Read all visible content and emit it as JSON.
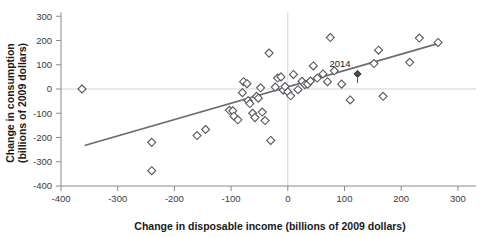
{
  "chart_data": {
    "type": "scatter",
    "title": "",
    "xlabel": "Change in disposable income (billions of 2009 dollars)",
    "ylabel": "Change in consumption (billions of 2009 dollars)",
    "xlim": [
      -400,
      300
    ],
    "ylim": [
      -400,
      300
    ],
    "xticks": [
      -400,
      -300,
      -200,
      -100,
      0,
      100,
      200,
      300
    ],
    "xticklabels": [
      "-400",
      "-300",
      "-200",
      "-100",
      "0",
      "100",
      "200",
      "300"
    ],
    "yticks": [
      -400,
      -300,
      -200,
      -100,
      0,
      100,
      200,
      300
    ],
    "yticklabels": [
      "-400",
      "-300",
      "-200",
      "-100",
      "0",
      "100",
      "200",
      "300"
    ],
    "grid": false,
    "zero_lines": true,
    "legend": null,
    "marker": "diamond",
    "marker_style": "open",
    "points": [
      {
        "x": -363,
        "y": 0
      },
      {
        "x": -240,
        "y": -220
      },
      {
        "x": -240,
        "y": -337
      },
      {
        "x": -160,
        "y": -192
      },
      {
        "x": -145,
        "y": -167
      },
      {
        "x": -103,
        "y": -88
      },
      {
        "x": -97,
        "y": -90
      },
      {
        "x": -95,
        "y": -112
      },
      {
        "x": -88,
        "y": -127
      },
      {
        "x": -80,
        "y": -15
      },
      {
        "x": -78,
        "y": 30
      },
      {
        "x": -72,
        "y": 22
      },
      {
        "x": -70,
        "y": -48
      },
      {
        "x": -67,
        "y": -60
      },
      {
        "x": -62,
        "y": -100
      },
      {
        "x": -58,
        "y": -118
      },
      {
        "x": -55,
        "y": -30
      },
      {
        "x": -52,
        "y": -38
      },
      {
        "x": -48,
        "y": 5
      },
      {
        "x": -45,
        "y": -95
      },
      {
        "x": -40,
        "y": -130
      },
      {
        "x": -33,
        "y": 148
      },
      {
        "x": -30,
        "y": -212
      },
      {
        "x": -22,
        "y": 8
      },
      {
        "x": -18,
        "y": 45
      },
      {
        "x": -12,
        "y": 50
      },
      {
        "x": -8,
        "y": -5
      },
      {
        "x": -5,
        "y": 10
      },
      {
        "x": 0,
        "y": -12
      },
      {
        "x": 5,
        "y": -28
      },
      {
        "x": 10,
        "y": 60
      },
      {
        "x": 18,
        "y": -3
      },
      {
        "x": 25,
        "y": 32
      },
      {
        "x": 30,
        "y": 18
      },
      {
        "x": 35,
        "y": 20
      },
      {
        "x": 40,
        "y": 33
      },
      {
        "x": 45,
        "y": 95
      },
      {
        "x": 52,
        "y": 45
      },
      {
        "x": 62,
        "y": 62
      },
      {
        "x": 70,
        "y": 30
      },
      {
        "x": 75,
        "y": 212
      },
      {
        "x": 82,
        "y": 75
      },
      {
        "x": 95,
        "y": 20
      },
      {
        "x": 110,
        "y": -45
      },
      {
        "x": 152,
        "y": 105
      },
      {
        "x": 160,
        "y": 160
      },
      {
        "x": 168,
        "y": -30
      },
      {
        "x": 215,
        "y": 110
      },
      {
        "x": 232,
        "y": 210
      },
      {
        "x": 265,
        "y": 192
      }
    ],
    "highlight_point": {
      "x": 123,
      "y": 62,
      "label": "2014",
      "style": "filled"
    },
    "trend_line": {
      "x_start": -357,
      "y_start": -232,
      "x_end": 266,
      "y_end": 188,
      "color": "#6b6b72"
    }
  },
  "annotations": {
    "year_label": "2014"
  }
}
